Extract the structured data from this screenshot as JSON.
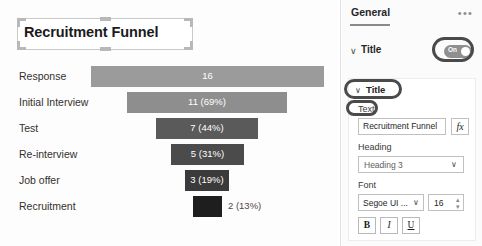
{
  "chart_data": {
    "type": "bar",
    "chart_kind": "funnel",
    "title": "Recruitment Funnel",
    "categories": [
      "Response",
      "Initial Interview",
      "Test",
      "Re-interview",
      "Job offer",
      "Recruitment"
    ],
    "values": [
      16,
      11,
      7,
      5,
      3,
      2
    ],
    "percents": [
      null,
      69,
      44,
      31,
      19,
      13
    ],
    "data_labels": [
      "16",
      "11 (69%)",
      "7 (44%)",
      "5 (31%)",
      "3 (19%)",
      "2 (13%)"
    ],
    "label_position": [
      "inside",
      "inside",
      "inside",
      "inside",
      "inside",
      "outside"
    ],
    "bar_colors": [
      "#9b9b9b",
      "#8e8e8e",
      "#5a5a5a",
      "#4b4b4b",
      "#3a3a3a",
      "#1e1e1e"
    ],
    "xlabel": "",
    "ylabel": "",
    "grid": false,
    "legend": "none"
  },
  "canvas": {
    "title_text": "Recruitment Funnel",
    "selection_active": true
  },
  "panel": {
    "tabs": [
      {
        "label": "General",
        "active": true
      }
    ],
    "more_icon": "•••",
    "title_section": {
      "chevron": "∨",
      "label": "Title",
      "toggle": {
        "state_label": "On",
        "enabled": true
      }
    },
    "card": {
      "chevron": "∨",
      "header": "Title",
      "text": {
        "label": "Text",
        "value": "Recruitment Funnel",
        "fx_label": "fx"
      },
      "heading": {
        "label": "Heading",
        "value": "Heading 3",
        "chevron": "∨"
      },
      "font": {
        "label": "Font",
        "family_value": "Segoe UI ...",
        "family_chevron": "∨",
        "size_value": "16",
        "spinner_up": "▴",
        "spinner_down": "▾",
        "bold_label": "B",
        "italic_label": "I",
        "underline_label": "U"
      }
    }
  },
  "colors": {
    "panel_bg": "#fbfbfb",
    "card_bg": "#ffffff",
    "annotation": "#4a4a4a",
    "toggle_on": "#8f8f8f"
  }
}
